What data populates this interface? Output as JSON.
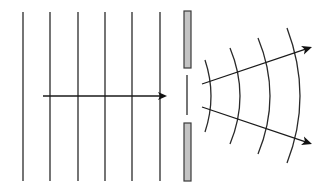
{
  "diagram": {
    "colors": {
      "line": "#2a2a2a",
      "arrow": "#111111",
      "barrier_fill": "#c4c4c4",
      "barrier_stroke": "#3a3a3a",
      "background": "#ffffff"
    },
    "incident_wavefronts": {
      "count": 6,
      "x_positions": [
        23,
        50,
        78,
        105,
        132,
        160
      ],
      "y_top": 12,
      "y_bottom": 181
    },
    "incident_arrow": {
      "label": "direction of propagation",
      "x1": 43,
      "y1": 96,
      "x2": 167,
      "y2": 96
    },
    "barrier": {
      "upper": {
        "x": 184,
        "y": 11,
        "width": 7,
        "height": 57
      },
      "lower": {
        "x": 184,
        "y": 123,
        "width": 7,
        "height": 58
      },
      "slit_line": {
        "x": 187,
        "y1": 75,
        "y2": 115
      }
    },
    "diffracted_wavefronts": [
      {
        "x_top": 205,
        "y_top": 60,
        "x_mid": 211,
        "y_mid": 96,
        "x_bottom": 205,
        "y_bottom": 132
      },
      {
        "x_top": 230,
        "y_top": 48,
        "x_mid": 240,
        "y_mid": 96,
        "x_bottom": 230,
        "y_bottom": 144
      },
      {
        "x_top": 258,
        "y_top": 38,
        "x_mid": 270,
        "y_mid": 96,
        "x_bottom": 258,
        "y_bottom": 154
      },
      {
        "x_top": 287,
        "y_top": 28,
        "x_mid": 300,
        "y_mid": 96,
        "x_bottom": 287,
        "y_bottom": 163
      }
    ],
    "diffracted_arrows": [
      {
        "label": "upper diffracted ray",
        "x1": 202,
        "y1": 84,
        "x2": 312,
        "y2": 47
      },
      {
        "label": "lower diffracted ray",
        "x1": 202,
        "y1": 107,
        "x2": 312,
        "y2": 144
      }
    ]
  }
}
